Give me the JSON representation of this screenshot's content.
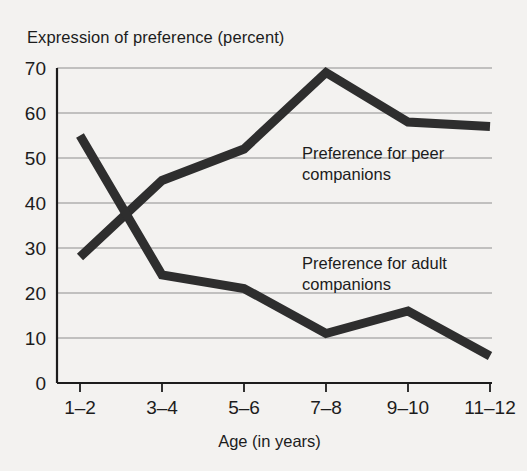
{
  "figure": {
    "background_color": "#f3f2f0",
    "line_color": "#2e2e2e",
    "grid_color": "#8e8e8e",
    "axis_color": "#1c1c1c"
  },
  "title": "Expression of preference (percent)",
  "x_axis_title": "Age (in years)",
  "annotations": {
    "peer_line1": "Preference for peer",
    "peer_line2": "companions",
    "adult_line1": "Preference for adult",
    "adult_line2": "companions"
  },
  "chart_data": {
    "type": "line",
    "title": "Expression of preference (percent)",
    "subtitle": "",
    "xlabel": "Age (in years)",
    "ylabel": "Expression of preference (percent)",
    "categories": [
      "1–2",
      "3–4",
      "5–6",
      "7–8",
      "9–10",
      "11–12"
    ],
    "x_tick_labels": [
      "1–2",
      "3–4",
      "5–6",
      "7–8",
      "9–10",
      "11–12"
    ],
    "y_tick_labels": [
      "0",
      "10",
      "20",
      "30",
      "40",
      "50",
      "60",
      "70"
    ],
    "y_ticks": [
      0,
      10,
      20,
      30,
      40,
      50,
      60,
      70
    ],
    "ylim": [
      0,
      70
    ],
    "grid": "horizontal",
    "legend": "inline-annotations",
    "series": [
      {
        "name": "Preference for peer companions",
        "values": [
          28,
          45,
          52,
          69,
          58,
          57
        ],
        "color": "#2e2e2e",
        "annotation": "Preference for peer companions"
      },
      {
        "name": "Preference for adult companions",
        "values": [
          55,
          24,
          21,
          11,
          16,
          6
        ],
        "color": "#2e2e2e",
        "annotation": "Preference for adult companions"
      }
    ]
  }
}
